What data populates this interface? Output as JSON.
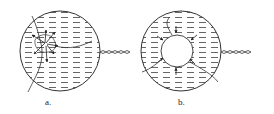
{
  "figures": [
    {
      "id": "a",
      "label": "a."
    },
    {
      "id": "b",
      "label": "b."
    }
  ],
  "colors": {
    "stroke": "#333333",
    "background": "#ffffff"
  }
}
